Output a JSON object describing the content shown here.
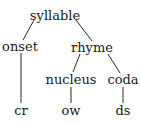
{
  "diagram": {
    "type": "syllable-tree",
    "nodes": {
      "syllable": "syllable",
      "onset": "onset",
      "rhyme": "rhyme",
      "nucleus": "nucleus",
      "coda": "coda",
      "onset_leaf": "cr",
      "nucleus_leaf": "ow",
      "coda_leaf": "ds"
    },
    "edges": [
      [
        "syllable",
        "onset"
      ],
      [
        "syllable",
        "rhyme"
      ],
      [
        "onset",
        "cr"
      ],
      [
        "rhyme",
        "nucleus"
      ],
      [
        "rhyme",
        "coda"
      ],
      [
        "nucleus",
        "ow"
      ],
      [
        "coda",
        "ds"
      ]
    ],
    "colors": {
      "ink": "#1a1a1a",
      "background": "#ffffff"
    }
  }
}
